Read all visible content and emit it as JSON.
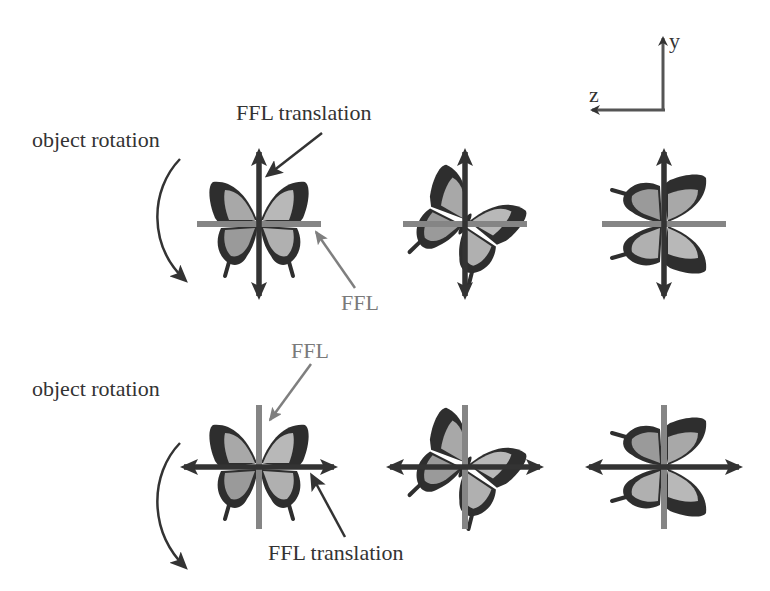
{
  "figure": {
    "axes": {
      "y_label": "y",
      "z_label": "z"
    },
    "top_row": {
      "rotation_label": "object rotation",
      "translation_label": "FFL translation",
      "ffl_label": "FFL",
      "translation_axis": "vertical",
      "ffl_axis": "horizontal",
      "butterfly_orientations_deg": [
        0,
        45,
        90
      ]
    },
    "bottom_row": {
      "rotation_label": "object rotation",
      "translation_label": "FFL translation",
      "ffl_label": "FFL",
      "translation_axis": "horizontal",
      "ffl_axis": "vertical",
      "butterfly_orientations_deg": [
        0,
        45,
        90
      ]
    },
    "colors": {
      "dark_arrow": "#333333",
      "ffl_line": "#858585",
      "wing_dark": "#2e2e2e",
      "wing_light": "#a8a8a8",
      "wing_mid": "#8c8c8c",
      "text_dark": "#333333",
      "text_gray": "#7a7a7a"
    }
  }
}
